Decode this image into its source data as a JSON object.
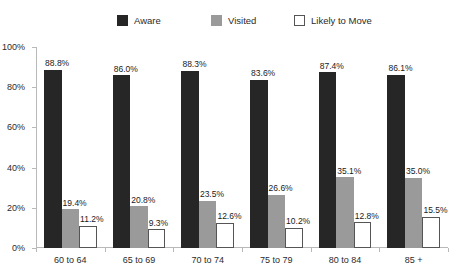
{
  "chart_data": {
    "type": "bar",
    "title": "",
    "subtitle": "",
    "xlabel": "",
    "ylabel": "",
    "ylim": [
      0,
      100
    ],
    "yticks": [
      "0%",
      "20%",
      "40%",
      "60%",
      "80%",
      "100%"
    ],
    "ytick_values": [
      0,
      20,
      40,
      60,
      80,
      100
    ],
    "grid": false,
    "legend_position": "top",
    "categories": [
      "60 to 64",
      "65 to 69",
      "70 to 74",
      "75 to 79",
      "80 to 84",
      "85 +"
    ],
    "series": [
      {
        "name": "Aware",
        "color": "#262626",
        "values": [
          88.8,
          86.0,
          88.3,
          83.6,
          87.4,
          86.1
        ],
        "labels": [
          "88.8%",
          "86.0%",
          "88.3%",
          "83.6%",
          "87.4%",
          "86.1%"
        ]
      },
      {
        "name": "Visited",
        "color": "#9a9a9a",
        "values": [
          19.4,
          20.8,
          23.5,
          26.6,
          35.1,
          35.0
        ],
        "labels": [
          "19.4%",
          "20.8%",
          "23.5%",
          "26.6%",
          "35.1%",
          "35.0%"
        ]
      },
      {
        "name": "Likely to Move",
        "color": "#ffffff",
        "values": [
          11.2,
          9.3,
          12.6,
          10.2,
          12.8,
          15.5
        ],
        "labels": [
          "11.2%",
          "9.3%",
          "12.6%",
          "10.2%",
          "12.8%",
          "15.5%"
        ]
      }
    ]
  },
  "legend": {
    "items": [
      {
        "label": "Aware"
      },
      {
        "label": "Visited"
      },
      {
        "label": "Likely to Move"
      }
    ]
  }
}
